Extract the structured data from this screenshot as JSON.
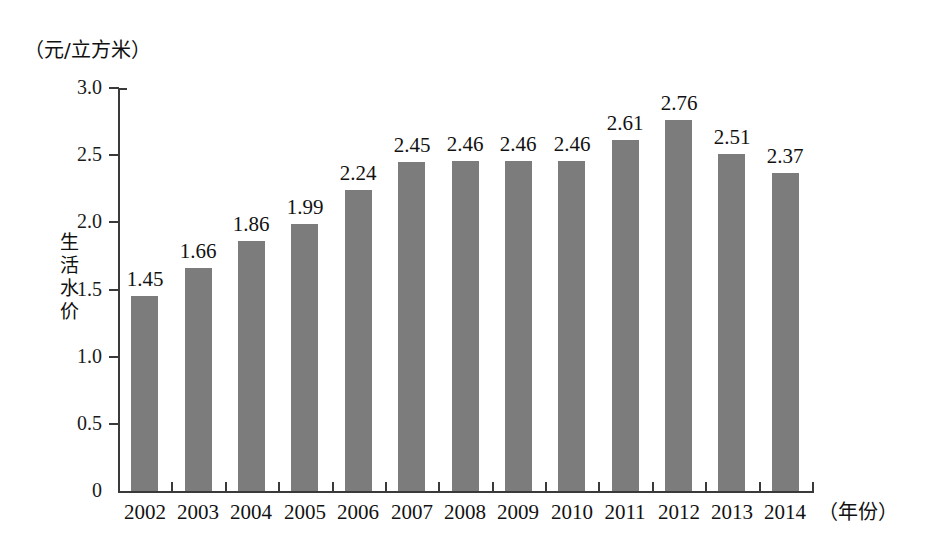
{
  "chart_data": {
    "type": "bar",
    "title": "",
    "subtitle": "",
    "xlabel": "（年份）",
    "ylabel": "生活水价",
    "unit_label": "（元/立方米）",
    "categories": [
      "2002",
      "2003",
      "2004",
      "2005",
      "2006",
      "2007",
      "2008",
      "2009",
      "2010",
      "2011",
      "2012",
      "2013",
      "2014"
    ],
    "values": [
      1.45,
      1.66,
      1.86,
      1.99,
      2.24,
      2.45,
      2.46,
      2.46,
      2.46,
      2.61,
      2.76,
      2.51,
      2.37
    ],
    "value_labels": [
      "1.45",
      "1.66",
      "1.86",
      "1.99",
      "2.24",
      "2.45",
      "2.46",
      "2.46",
      "2.46",
      "2.61",
      "2.76",
      "2.51",
      "2.37"
    ],
    "ylim": [
      0,
      3.0
    ],
    "ytick_values": [
      0,
      0.5,
      1.0,
      1.5,
      2.0,
      2.5,
      3.0
    ],
    "ytick_labels": [
      "0",
      "0.5",
      "1.0",
      "1.5",
      "2.0",
      "2.5",
      "3.0"
    ],
    "grid": false,
    "legend": null,
    "series_color": "#7c7c7c",
    "axis_color": "#3a3a3a",
    "text_color": "#121212",
    "background": "#ffffff"
  },
  "yaxis_title_chars": [
    "生",
    "活",
    "水",
    "价"
  ]
}
